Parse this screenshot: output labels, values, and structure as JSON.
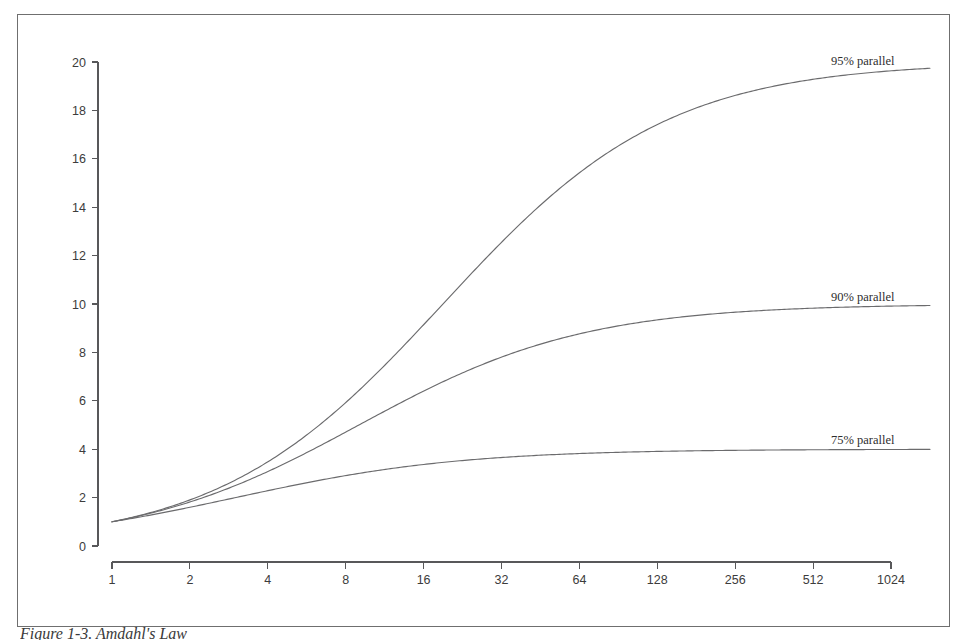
{
  "figure": {
    "caption": "Figure 1-3. Amdahl's Law",
    "border_color": "#6f6f6f",
    "background_color": "#ffffff"
  },
  "chart_data": {
    "type": "line",
    "title": "",
    "xlabel": "",
    "ylabel": "",
    "xscale": "log2",
    "xlim": [
      1,
      1448
    ],
    "ylim": [
      0,
      20
    ],
    "grid": false,
    "legend_position": "inline-right-of-curve",
    "x_ticks": [
      1,
      2,
      4,
      8,
      16,
      32,
      64,
      128,
      256,
      512,
      1024
    ],
    "x_tick_labels": [
      "1",
      "2",
      "4",
      "8",
      "16",
      "32",
      "64",
      "128",
      "256",
      "512",
      "1024"
    ],
    "y_ticks": [
      0,
      2,
      4,
      6,
      8,
      10,
      12,
      14,
      16,
      18,
      20
    ],
    "y_tick_labels": [
      "0",
      "2",
      "4",
      "6",
      "8",
      "10",
      "12",
      "14",
      "16",
      "18",
      "20"
    ],
    "x": [
      1,
      2,
      4,
      8,
      16,
      32,
      64,
      128,
      256,
      512,
      1024,
      1448
    ],
    "line_color": "#6b6b6d",
    "series": [
      {
        "name": "95% parallel",
        "label": "95% parallel",
        "parallel_fraction": 0.95,
        "asymptote": 20,
        "values": [
          1.0,
          1.9,
          3.48,
          5.93,
          9.14,
          12.55,
          15.42,
          17.41,
          18.62,
          19.28,
          19.64,
          19.74
        ],
        "label_x": 1024,
        "label_y": 19.65
      },
      {
        "name": "90% parallel",
        "label": "90% parallel",
        "parallel_fraction": 0.9,
        "asymptote": 10,
        "values": [
          1.0,
          1.82,
          3.08,
          4.71,
          6.4,
          7.8,
          8.77,
          9.34,
          9.66,
          9.83,
          9.91,
          9.94
        ],
        "label_x": 1024,
        "label_y": 9.9
      },
      {
        "name": "75% parallel",
        "label": "75% parallel",
        "parallel_fraction": 0.75,
        "asymptote": 4,
        "values": [
          1.0,
          1.6,
          2.29,
          2.91,
          3.37,
          3.66,
          3.82,
          3.91,
          3.95,
          3.98,
          3.99,
          3.99
        ],
        "label_x": 1024,
        "label_y": 3.99
      }
    ]
  }
}
